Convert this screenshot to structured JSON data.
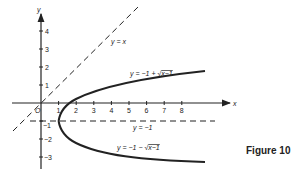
{
  "figure": {
    "caption": "Figure 10",
    "axes": {
      "x_label": "x",
      "y_label": "y",
      "origin_label": "O",
      "x_ticks": [
        "1",
        "2",
        "3",
        "4",
        "5",
        "6",
        "7",
        "8"
      ],
      "y_ticks_pos": [
        "1",
        "2",
        "3",
        "4"
      ],
      "y_ticks_neg": [
        "−1",
        "−2",
        "−3"
      ]
    },
    "curves": {
      "diag_label": "y = x",
      "upper_label": "y = −1 + √x−1",
      "upper_prefix": "y = −1 + √",
      "upper_radicand": "x−1",
      "lower_prefix": "y = −1 − √",
      "lower_radicand": "x−1",
      "asymptote_label": "y = −1"
    },
    "colors": {
      "ink": "#222222",
      "background": "#ffffff"
    }
  }
}
